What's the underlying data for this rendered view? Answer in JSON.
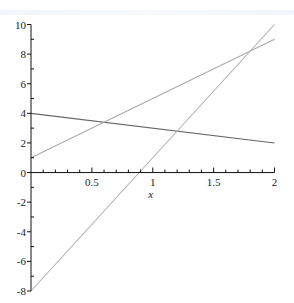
{
  "chart_data": {
    "type": "line",
    "title": "",
    "xlabel": "x",
    "ylabel": "",
    "xlim": [
      0,
      2
    ],
    "ylim": [
      -8,
      10
    ],
    "grid": false,
    "legend": null,
    "x_ticks": {
      "major": [
        0.5,
        1,
        1.5,
        2
      ],
      "labels": [
        "0.5",
        "1",
        "1.5",
        "2"
      ],
      "minor_step": 0.1
    },
    "y_ticks": {
      "major": [
        -8,
        -6,
        -4,
        -2,
        0,
        2,
        4,
        6,
        8,
        10
      ],
      "labels": [
        "-8",
        "-6",
        "-4",
        "-2",
        "0",
        "2",
        "4",
        "6",
        "8",
        "10"
      ],
      "minor_step": 1
    },
    "series": [
      {
        "name": "4 - x",
        "x": [
          0,
          2
        ],
        "values": [
          4,
          2
        ],
        "color": "#666666"
      },
      {
        "name": "4x + 1",
        "x": [
          0,
          2
        ],
        "values": [
          1,
          9
        ],
        "color": "#aaaaaa"
      },
      {
        "name": "9x - 8",
        "x": [
          0,
          2
        ],
        "values": [
          -8,
          10
        ],
        "color": "#b0b0b0"
      }
    ]
  },
  "layout": {
    "x0_px": 31,
    "x2_px": 274.5,
    "y10_px": 24.5,
    "yneg8_px": 291
  }
}
